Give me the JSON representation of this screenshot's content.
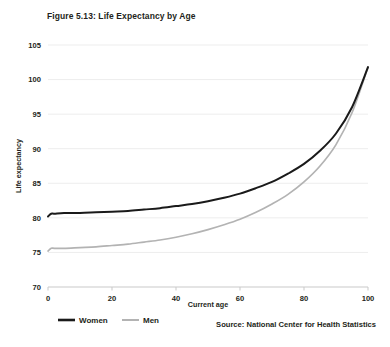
{
  "figure": {
    "title": "Figure 5.13: Life Expectancy by Age",
    "source": "Source: National Center for Health Statistics"
  },
  "legend": {
    "items": [
      {
        "label": "Women",
        "color": "#1a1a1a"
      },
      {
        "label": "Men",
        "color": "#b3b3b3"
      }
    ]
  },
  "colors": {
    "women_line": "#1a1a1a",
    "men_line": "#b3b3b3",
    "gridline": "#ededed",
    "axis": "#c9c9c9",
    "text": "#231f20",
    "background": "#ffffff"
  },
  "chart_data": {
    "type": "line",
    "title": "Figure 5.13: Life Expectancy by Age",
    "xlabel": "Current age",
    "ylabel": "Life expectancy",
    "xlim": [
      0,
      100
    ],
    "ylim": [
      70,
      105
    ],
    "xticks": [
      0,
      20,
      40,
      60,
      80,
      100
    ],
    "yticks": [
      70,
      75,
      80,
      85,
      90,
      95,
      100,
      105
    ],
    "grid": true,
    "legend_position": "bottom-left",
    "x": [
      0,
      1,
      2,
      5,
      10,
      15,
      20,
      25,
      30,
      35,
      40,
      45,
      50,
      55,
      60,
      65,
      70,
      75,
      80,
      85,
      90,
      95,
      100
    ],
    "series": [
      {
        "name": "Women",
        "color": "#1a1a1a",
        "values": [
          80.2,
          80.6,
          80.6,
          80.7,
          80.7,
          80.8,
          80.9,
          81.0,
          81.2,
          81.4,
          81.7,
          82.0,
          82.4,
          82.9,
          83.5,
          84.3,
          85.2,
          86.4,
          87.8,
          89.7,
          92.2,
          96.0,
          101.8
        ]
      },
      {
        "name": "Men",
        "color": "#b3b3b3",
        "values": [
          75.2,
          75.6,
          75.6,
          75.6,
          75.7,
          75.8,
          76.0,
          76.2,
          76.5,
          76.8,
          77.2,
          77.7,
          78.3,
          79.0,
          79.8,
          80.8,
          82.0,
          83.4,
          85.2,
          87.5,
          90.6,
          95.2,
          101.8
        ]
      }
    ]
  },
  "axes": {
    "x_tick_labels": [
      "0",
      "20",
      "40",
      "60",
      "80",
      "100"
    ],
    "y_tick_labels": [
      "70",
      "75",
      "80",
      "85",
      "90",
      "95",
      "100",
      "105"
    ]
  }
}
